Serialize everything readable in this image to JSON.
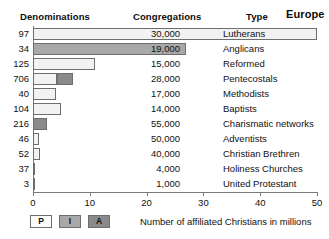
{
  "header": {
    "col_denominations": "Denominations",
    "col_congregations": "Congregations",
    "col_type": "Type",
    "region": "Europe"
  },
  "axis_caption": "Number of affiliated Christians in millions",
  "legend": [
    {
      "key": "P",
      "label": "P",
      "color": "#fbfbfb"
    },
    {
      "key": "I",
      "label": "I",
      "color": "#a8a8a8"
    },
    {
      "key": "A",
      "label": "A",
      "color": "#8a8a8a"
    }
  ],
  "chart_data": {
    "type": "bar",
    "orientation": "horizontal",
    "title": "Europe",
    "xlabel": "Number of affiliated Christians in millions",
    "ylabel": "",
    "xlim": [
      0,
      50
    ],
    "xticks": [
      0,
      10,
      20,
      30,
      40,
      50
    ],
    "xtick_labels": [
      "0",
      "10",
      "20",
      "30",
      "40",
      "50"
    ],
    "grid": false,
    "legend_position": "bottom-left",
    "series": [
      {
        "name": "P",
        "color": "#f2f2f2"
      },
      {
        "name": "I",
        "color": "#a8a8a8"
      },
      {
        "name": "A",
        "color": "#8a8a8a"
      }
    ],
    "categories": [
      "Lutherans",
      "Anglicans",
      "Reformed",
      "Pentecostals",
      "Methodists",
      "Baptists",
      "Charismatic networks",
      "Adventists",
      "Christian Brethren",
      "Holiness Churches",
      "United Protestant"
    ],
    "values": [
      50,
      27,
      11,
      7,
      4,
      5,
      2.5,
      1,
      1.2,
      0.3,
      0.2
    ]
  },
  "rows": [
    {
      "denominations": "97",
      "congregations": "30,000",
      "type": "Lutherans",
      "value": 50,
      "segments": [
        {
          "series": "P",
          "from": 0,
          "to": 50
        }
      ]
    },
    {
      "denominations": "34",
      "congregations": "19,000",
      "type": "Anglicans",
      "value": 27,
      "segments": [
        {
          "series": "I",
          "from": 0,
          "to": 27
        }
      ]
    },
    {
      "denominations": "125",
      "congregations": "15,000",
      "type": "Reformed",
      "value": 11,
      "segments": [
        {
          "series": "P",
          "from": 0,
          "to": 11
        }
      ]
    },
    {
      "denominations": "706",
      "congregations": "28,000",
      "type": "Pentecostals",
      "value": 7,
      "segments": [
        {
          "series": "P",
          "from": 0,
          "to": 4.3
        },
        {
          "series": "A",
          "from": 4.3,
          "to": 7
        }
      ]
    },
    {
      "denominations": "40",
      "congregations": "17,000",
      "type": "Methodists",
      "value": 4,
      "segments": [
        {
          "series": "P",
          "from": 0,
          "to": 4
        }
      ]
    },
    {
      "denominations": "104",
      "congregations": "14,000",
      "type": "Baptists",
      "value": 5,
      "segments": [
        {
          "series": "P",
          "from": 0,
          "to": 5
        }
      ]
    },
    {
      "denominations": "216",
      "congregations": "55,000",
      "type": "Charismatic networks",
      "value": 2.5,
      "segments": [
        {
          "series": "A",
          "from": 0,
          "to": 2.5
        }
      ]
    },
    {
      "denominations": "46",
      "congregations": "50,000",
      "type": "Adventists",
      "value": 1,
      "segments": [
        {
          "series": "P",
          "from": 0,
          "to": 1
        }
      ]
    },
    {
      "denominations": "52",
      "congregations": "40,000",
      "type": "Christian Brethren",
      "value": 1.2,
      "segments": [
        {
          "series": "P",
          "from": 0,
          "to": 1.2
        }
      ]
    },
    {
      "denominations": "37",
      "congregations": "4,000",
      "type": "Holiness Churches",
      "value": 0.3,
      "segments": [
        {
          "series": "P",
          "from": 0,
          "to": 0.3
        }
      ]
    },
    {
      "denominations": "3",
      "congregations": "1,000",
      "type": "United Protestant",
      "value": 0.2,
      "segments": [
        {
          "series": "P",
          "from": 0,
          "to": 0.2
        }
      ]
    }
  ]
}
